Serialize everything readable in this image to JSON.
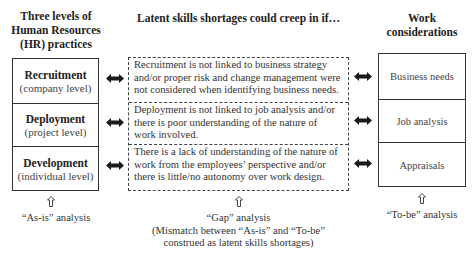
{
  "left_column": {
    "heading_lines": [
      "Three levels of",
      "Human Resources",
      "(HR) practices"
    ],
    "items": [
      {
        "title": "Recruitment",
        "subtitle": "(company level)"
      },
      {
        "title": "Deployment",
        "subtitle": "(project level)"
      },
      {
        "title": "Development",
        "subtitle": "(individual level)"
      }
    ],
    "caption": "“As-is” analysis"
  },
  "middle_column": {
    "heading": "Latent skills shortages could creep in if…",
    "items": [
      {
        "lines": [
          "Recruitment is not linked to business strategy",
          "and/or proper risk and change management were",
          "not considered when identifying business needs."
        ]
      },
      {
        "lines": [
          "Deployment is not linked to job analysis and/or",
          "there is poor understanding of the nature of",
          "work involved."
        ]
      },
      {
        "lines": [
          "There is a lack of understanding of the nature of",
          "work from the employees’ perspective and/or",
          "there is little/no autonomy over work design."
        ]
      }
    ],
    "caption_lines": [
      "“Gap” analysis",
      "(Mismatch between “As-is” and “To-be”",
      "construed as latent skills shortages)"
    ]
  },
  "right_column": {
    "heading_lines": [
      "Work",
      "considerations"
    ],
    "items": [
      {
        "label": "Business needs"
      },
      {
        "label": "Job analysis"
      },
      {
        "label": "Appraisals"
      }
    ],
    "caption": "“To-be” analysis"
  },
  "icons": {
    "connector": "double-headed-arrow",
    "analysis_pointer": "hollow-up-arrow"
  },
  "colors": {
    "line": "#333333",
    "arrow_fill": "#1a1a1a",
    "text": "#333333",
    "background": "#ffffff"
  }
}
